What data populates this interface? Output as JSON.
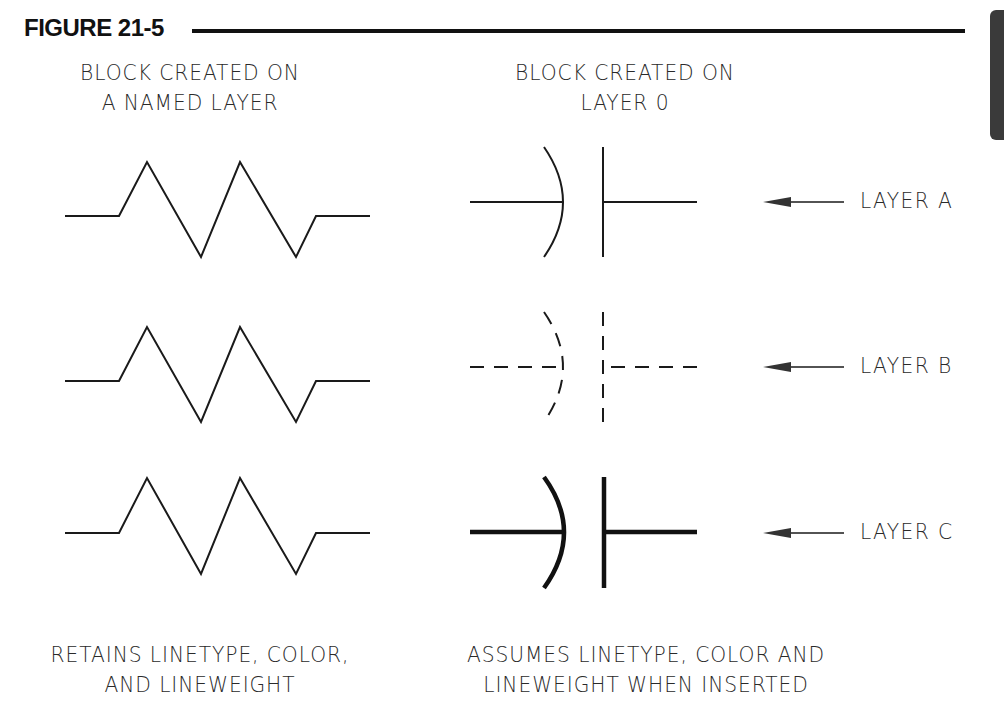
{
  "figure": {
    "title": "FIGURE 21-5"
  },
  "headers": {
    "left": [
      "BLOCK CREATED ON",
      "A NAMED LAYER"
    ],
    "right": [
      "BLOCK CREATED ON",
      "LAYER 0"
    ]
  },
  "rows": [
    {
      "layer_label": "LAYER A",
      "linetype": "continuous",
      "lineweight": "thin"
    },
    {
      "layer_label": "LAYER B",
      "linetype": "dashed",
      "lineweight": "thin"
    },
    {
      "layer_label": "LAYER C",
      "linetype": "continuous",
      "lineweight": "heavy"
    }
  ],
  "symbols": {
    "left_block": "resistor-symbol",
    "right_block": "capacitor-symbol",
    "pointer": "arrow-left-icon"
  },
  "footers": {
    "left": [
      "RETAINS LINETYPE, COLOR,",
      "AND LINEWEIGHT"
    ],
    "right": [
      "ASSUMES LINETYPE, COLOR AND",
      "LINEWEIGHT WHEN INSERTED"
    ]
  },
  "colors": {
    "ink": "#1a1a1a",
    "background": "#ffffff",
    "tab": "#3a3a3a"
  }
}
